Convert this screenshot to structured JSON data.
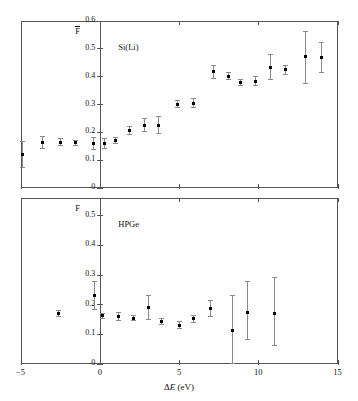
{
  "figure": {
    "width": 358,
    "height": 401,
    "background": "#ffffff",
    "marker_color": "#000000",
    "errorbar_color": "#8a8a8a",
    "axis_color": "#555555"
  },
  "xaxis": {
    "label_plain": "ΔE (eV)",
    "label_delta": "Δ",
    "label_var": "E",
    "label_unit": " (eV)",
    "ticks": [
      -5,
      0,
      5,
      10,
      15
    ],
    "ticklabels": [
      "−5",
      "0",
      "5",
      "10",
      "15"
    ],
    "min": -5,
    "max": 15
  },
  "chart_data": [
    {
      "type": "scatter",
      "panel": "top",
      "title": "Si(Li)",
      "ylabel": "F",
      "ylabel_has_overbar": true,
      "xlabel": "ΔE (eV)",
      "xlim": [
        -5,
        15
      ],
      "ylim": [
        0,
        0.6
      ],
      "yticks": [
        0,
        0.1,
        0.2,
        0.3,
        0.4,
        0.5,
        0.6
      ],
      "yticklabels": [
        "0",
        "0.1",
        "0.2",
        "0.3",
        "0.4",
        "0.5",
        "0.6"
      ],
      "grid": false,
      "legend": "none",
      "x": [
        -4.9,
        -3.6,
        -2.5,
        -1.5,
        -0.4,
        0.3,
        1.0,
        1.9,
        2.8,
        3.7,
        4.9,
        5.9,
        7.2,
        8.1,
        8.9,
        9.8,
        10.8,
        11.7,
        13.0,
        14.0
      ],
      "y": [
        0.122,
        0.164,
        0.164,
        0.163,
        0.16,
        0.16,
        0.172,
        0.206,
        0.226,
        0.226,
        0.301,
        0.304,
        0.417,
        0.402,
        0.379,
        0.383,
        0.434,
        0.425,
        0.472,
        0.47
      ],
      "yerr_low": [
        0.05,
        0.022,
        0.013,
        0.009,
        0.02,
        0.017,
        0.011,
        0.014,
        0.022,
        0.03,
        0.012,
        0.016,
        0.024,
        0.013,
        0.012,
        0.016,
        0.045,
        0.016,
        0.097,
        0.054
      ],
      "yerr_high": [
        0.045,
        0.022,
        0.013,
        0.009,
        0.02,
        0.017,
        0.011,
        0.014,
        0.022,
        0.03,
        0.012,
        0.016,
        0.024,
        0.013,
        0.012,
        0.016,
        0.045,
        0.016,
        0.09,
        0.054
      ]
    },
    {
      "type": "scatter",
      "panel": "bottom",
      "title": "HPGe",
      "ylabel": "F",
      "ylabel_has_overbar": false,
      "xlabel": "ΔE (eV)",
      "xlim": [
        -5,
        15
      ],
      "ylim": [
        0,
        0.56
      ],
      "yticks": [
        0,
        0.1,
        0.2,
        0.3,
        0.4,
        0.5
      ],
      "yticklabels": [
        "0",
        "0.1",
        "0.2",
        "0.3",
        "0.4",
        "0.5"
      ],
      "grid": false,
      "legend": "none",
      "x": [
        -2.6,
        -0.3,
        0.2,
        1.2,
        2.1,
        3.1,
        3.9,
        5.0,
        5.9,
        7.0,
        8.4,
        9.3,
        11.0
      ],
      "y": [
        0.171,
        0.232,
        0.163,
        0.16,
        0.155,
        0.19,
        0.143,
        0.131,
        0.153,
        0.187,
        0.112,
        0.173,
        0.172
      ],
      "yerr_low": [
        0.01,
        0.047,
        0.008,
        0.013,
        0.007,
        0.041,
        0.01,
        0.012,
        0.012,
        0.026,
        0.11,
        0.09,
        0.108
      ],
      "yerr_high": [
        0.01,
        0.047,
        0.008,
        0.013,
        0.007,
        0.041,
        0.01,
        0.012,
        0.012,
        0.026,
        0.12,
        0.105,
        0.12
      ]
    }
  ]
}
